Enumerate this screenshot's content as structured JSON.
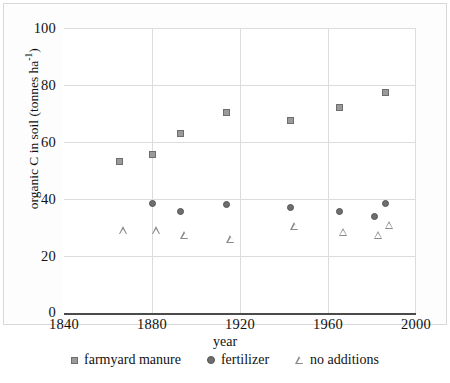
{
  "chart_data": {
    "type": "scatter",
    "title": "",
    "xlabel": "year",
    "ylabel": "organic C in soil (tonnes ha⁻¹)",
    "ylabel_main": "organic C in soil (tonnes ha",
    "ylabel_sup": "-1",
    "ylabel_close": ")",
    "xlim": [
      1840,
      2000
    ],
    "ylim": [
      0,
      100
    ],
    "xticks": [
      1840,
      1880,
      1920,
      1960,
      2000
    ],
    "yticks": [
      0,
      20,
      40,
      60,
      80,
      100
    ],
    "grid": true,
    "legend_position": "bottom",
    "series": [
      {
        "name": "farmyard manure",
        "marker": "square",
        "color": "#9a9a9a",
        "points": [
          {
            "x": 1865,
            "y": 53.0
          },
          {
            "x": 1880,
            "y": 55.5
          },
          {
            "x": 1893,
            "y": 63.0
          },
          {
            "x": 1914,
            "y": 70.5
          },
          {
            "x": 1943,
            "y": 67.5
          },
          {
            "x": 1965,
            "y": 72.0
          },
          {
            "x": 1986,
            "y": 77.5
          }
        ]
      },
      {
        "name": "fertilizer",
        "marker": "circle",
        "color": "#6e6e6e",
        "points": [
          {
            "x": 1880,
            "y": 38.5
          },
          {
            "x": 1893,
            "y": 35.5
          },
          {
            "x": 1914,
            "y": 38.0
          },
          {
            "x": 1943,
            "y": 37.0
          },
          {
            "x": 1965,
            "y": 35.5
          },
          {
            "x": 1981,
            "y": 34.0
          },
          {
            "x": 1986,
            "y": 38.5
          }
        ]
      },
      {
        "name": "no additions",
        "marker": "triangle",
        "color": "#8a8a8a",
        "points": [
          {
            "x": 1865,
            "y": 29.0
          },
          {
            "x": 1880,
            "y": 29.0
          },
          {
            "x": 1893,
            "y": 27.5
          },
          {
            "x": 1914,
            "y": 26.0
          },
          {
            "x": 1943,
            "y": 30.5
          },
          {
            "x": 1965,
            "y": 28.5
          },
          {
            "x": 1981,
            "y": 27.5
          },
          {
            "x": 1986,
            "y": 31.0
          }
        ]
      }
    ]
  },
  "legend": {
    "items": [
      {
        "label": "farmyard manure",
        "marker": "square"
      },
      {
        "label": "fertilizer",
        "marker": "circle"
      },
      {
        "label": "no additions",
        "marker": "triangle"
      }
    ]
  }
}
